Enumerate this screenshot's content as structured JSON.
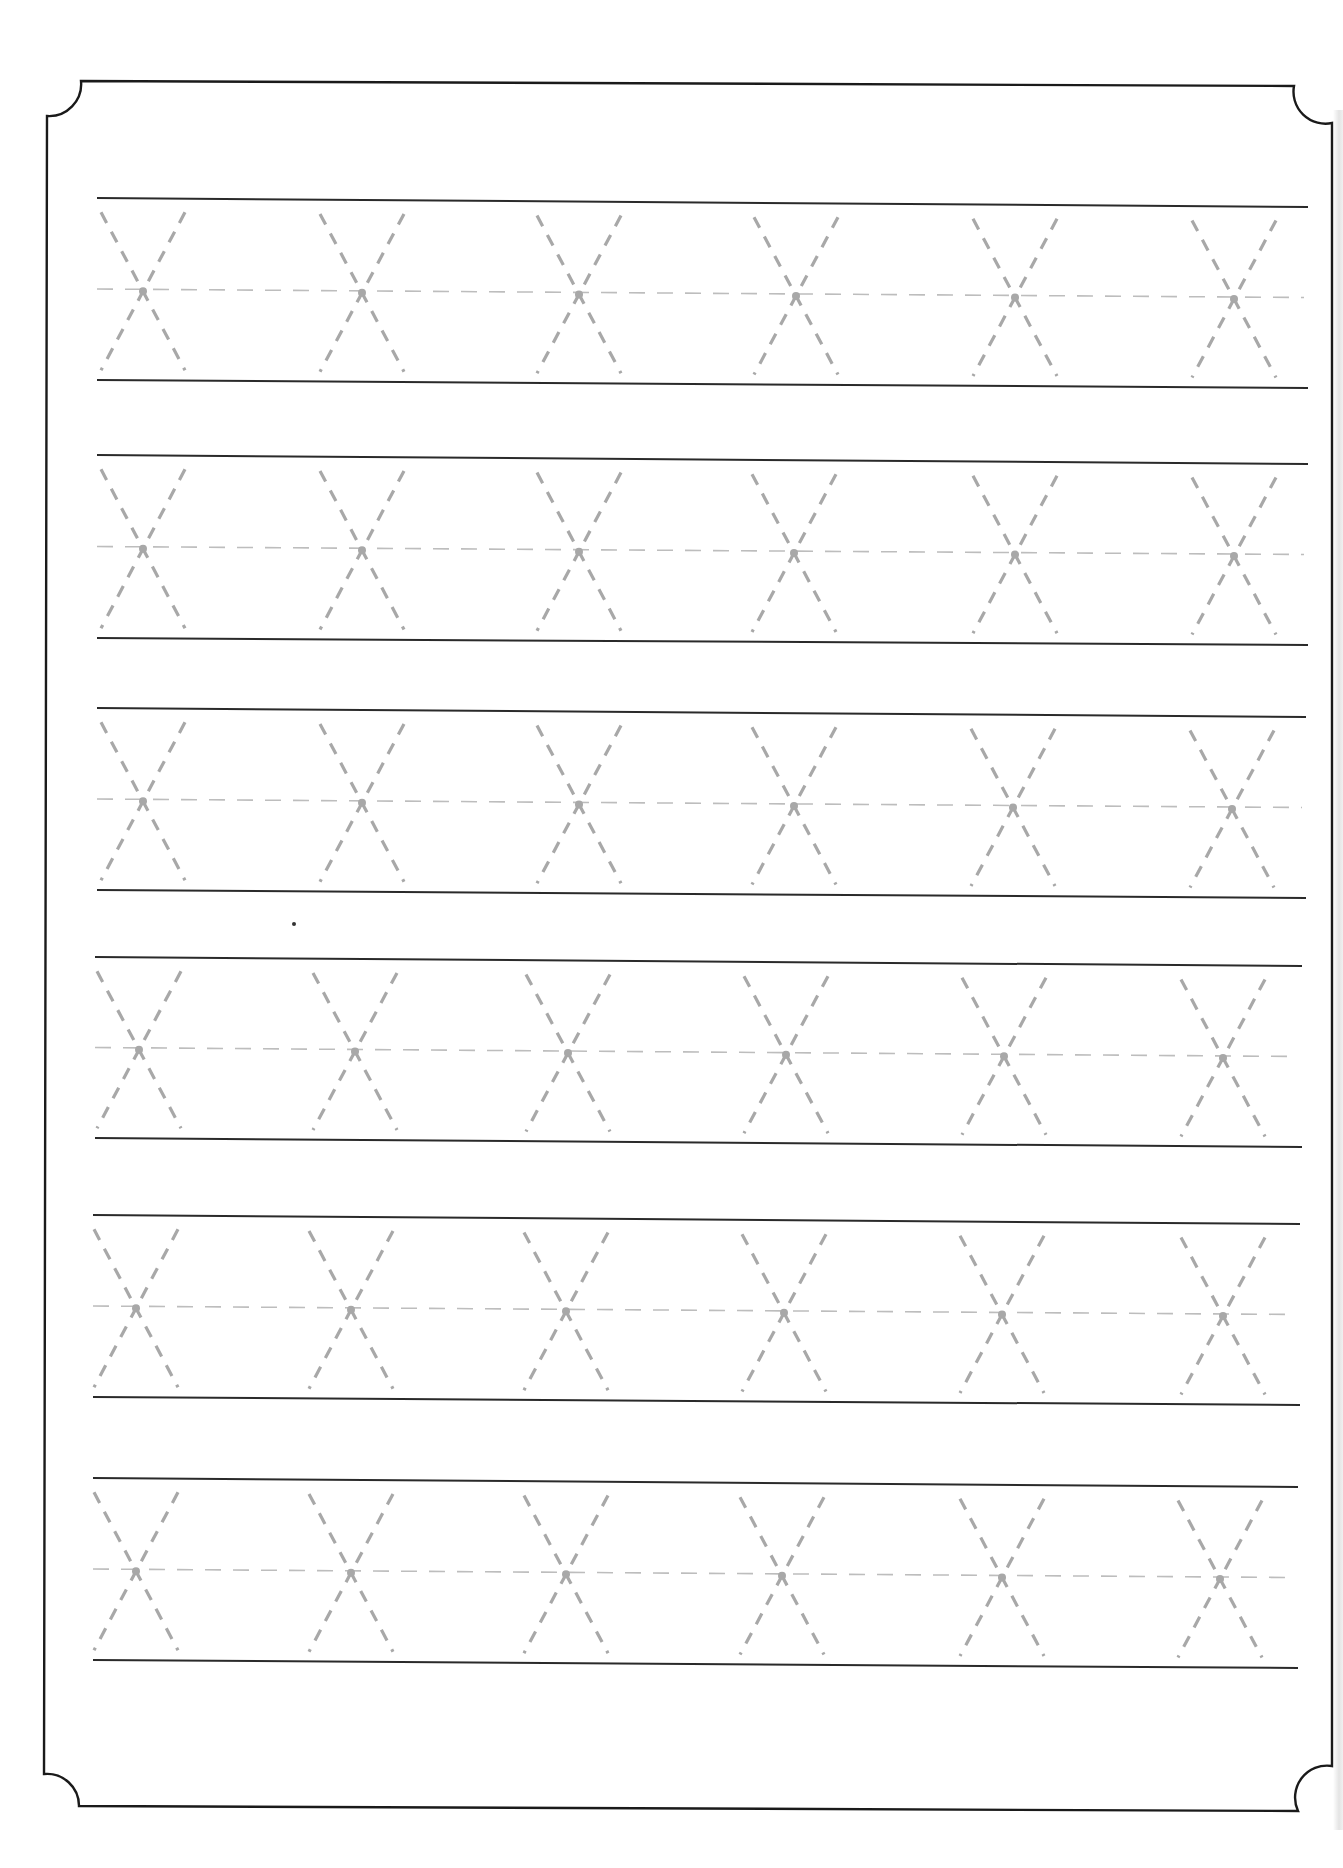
{
  "worksheet": {
    "letter": "X",
    "letters_per_row": 6,
    "row_count": 6,
    "colors": {
      "frame": "#1a1a1a",
      "guide_line": "#2a2a2a",
      "trace_stroke": "#a8a8a8",
      "midline": "#bdbdbd",
      "background": "#ffffff"
    },
    "frame": {
      "left": 45,
      "top": 81,
      "right": 1326,
      "bottom": 1806,
      "corner_radius": 32
    },
    "rows": [
      {
        "x1": 97,
        "x2": 1308,
        "top": [
          198,
          207
        ],
        "bottom": [
          380,
          388
        ],
        "letters": [
          143,
          362,
          579,
          796,
          1015,
          1234
        ]
      },
      {
        "x1": 97,
        "x2": 1308,
        "top": [
          455,
          464
        ],
        "bottom": [
          638,
          645
        ],
        "letters": [
          143,
          362,
          579,
          794,
          1015,
          1234
        ]
      },
      {
        "x1": 97,
        "x2": 1306,
        "top": [
          708,
          717
        ],
        "bottom": [
          890,
          898
        ],
        "letters": [
          143,
          362,
          579,
          794,
          1013,
          1232
        ]
      },
      {
        "x1": 95,
        "x2": 1302,
        "top": [
          957,
          966
        ],
        "bottom": [
          1138,
          1147
        ],
        "letters": [
          139,
          355,
          568,
          786,
          1004,
          1223
        ]
      },
      {
        "x1": 93,
        "x2": 1300,
        "top": [
          1215,
          1224
        ],
        "bottom": [
          1397,
          1405
        ],
        "letters": [
          136,
          351,
          566,
          784,
          1002,
          1223
        ]
      },
      {
        "x1": 93,
        "x2": 1298,
        "top": [
          1478,
          1487
        ],
        "bottom": [
          1660,
          1668
        ],
        "letters": [
          136,
          351,
          566,
          782,
          1002,
          1220
        ]
      }
    ],
    "stray_mark": {
      "x": 294,
      "y": 924
    }
  }
}
